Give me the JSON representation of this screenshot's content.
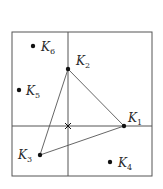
{
  "diagram": {
    "type": "spatial-partition-with-points",
    "frame": {
      "x": 12,
      "y": 32,
      "width": 140,
      "height": 144,
      "stroke": "#555555"
    },
    "dividers": {
      "vertical_x": 68,
      "horizontal_y": 126
    },
    "center_marker": {
      "x": 68,
      "y": 126,
      "glyph": "×"
    },
    "points": [
      {
        "id": "K1",
        "base": "K",
        "sub": "1",
        "x": 124,
        "y": 126,
        "label_dx": 4,
        "label_dy": -4
      },
      {
        "id": "K2",
        "base": "K",
        "sub": "2",
        "x": 68,
        "y": 69,
        "label_dx": 8,
        "label_dy": -4
      },
      {
        "id": "K3",
        "base": "K",
        "sub": "3",
        "x": 40,
        "y": 155,
        "label_dx": -22,
        "label_dy": 4
      },
      {
        "id": "K4",
        "base": "K",
        "sub": "4",
        "x": 110,
        "y": 162,
        "label_dx": 8,
        "label_dy": 5
      },
      {
        "id": "K5",
        "base": "K",
        "sub": "5",
        "x": 19,
        "y": 90,
        "label_dx": 7,
        "label_dy": 5
      },
      {
        "id": "K6",
        "base": "K",
        "sub": "6",
        "x": 33,
        "y": 46,
        "label_dx": 8,
        "label_dy": 5
      }
    ],
    "triangle": [
      "K1",
      "K2",
      "K3"
    ],
    "colors": {
      "line": "#555555",
      "point": "#111111",
      "text": "#2a2a2a"
    }
  }
}
